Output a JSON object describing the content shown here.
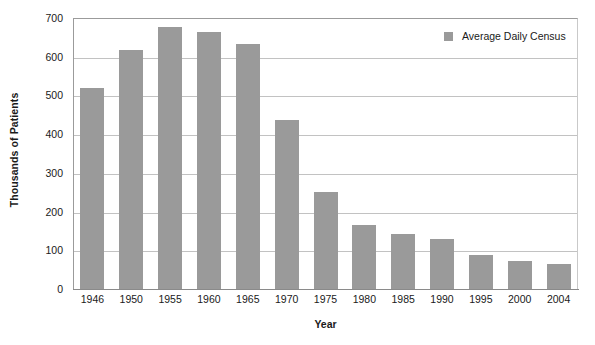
{
  "chart_data": {
    "type": "bar",
    "title": "",
    "xlabel": "Year",
    "ylabel": "Thousands of Patients",
    "categories": [
      "1946",
      "1950",
      "1955",
      "1960",
      "1965",
      "1970",
      "1975",
      "1980",
      "1985",
      "1990",
      "1995",
      "2000",
      "2004"
    ],
    "series": [
      {
        "name": "Average Daily Census",
        "values": [
          520,
          617,
          678,
          663,
          632,
          437,
          250,
          166,
          141,
          129,
          87,
          72,
          64
        ]
      }
    ],
    "values": [
      520,
      617,
      678,
      663,
      632,
      437,
      250,
      166,
      141,
      129,
      87,
      72,
      64
    ],
    "ylim": [
      0,
      700
    ],
    "yticks": [
      0,
      100,
      200,
      300,
      400,
      500,
      600,
      700
    ],
    "ytick_labels": [
      "0",
      "100",
      "200",
      "300",
      "400",
      "500",
      "600",
      "700"
    ],
    "grid": true,
    "grid_axis": "y",
    "legend": {
      "position": "top-right",
      "entries": [
        {
          "label": "Average Daily Census",
          "color": "#9a9a9a"
        }
      ]
    },
    "colors": {
      "bar": "#9a9a9a",
      "gridline": "#c2c2c2",
      "axis": "#8a8a8a",
      "text": "#1a1a1a",
      "background": "#ffffff"
    }
  }
}
